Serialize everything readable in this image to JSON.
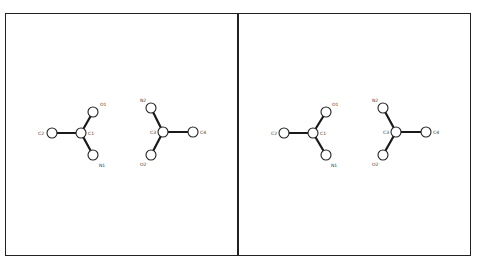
{
  "diagram": {
    "panels": [
      {
        "id": "left",
        "atoms": [
          {
            "label": "C2",
            "x": 52,
            "y": 133,
            "lx": 38,
            "ly": 135
          },
          {
            "label": "C1",
            "x": 81,
            "y": 133,
            "lx": 88,
            "ly": 135
          },
          {
            "label": "O1",
            "x": 93,
            "y": 112,
            "lx": 100,
            "ly": 106
          },
          {
            "label": "N1",
            "x": 93,
            "y": 155,
            "lx": 99,
            "ly": 167
          },
          {
            "label": "N2",
            "x": 151,
            "y": 108,
            "lx": 140,
            "ly": 102
          },
          {
            "label": "C3",
            "x": 163,
            "y": 132,
            "lx": 150,
            "ly": 134
          },
          {
            "label": "C4",
            "x": 193,
            "y": 132,
            "lx": 200,
            "ly": 134
          },
          {
            "label": "O2",
            "x": 151,
            "y": 155,
            "lx": 140,
            "ly": 166
          }
        ],
        "bonds": [
          [
            "C2",
            "C1"
          ],
          [
            "C1",
            "O1"
          ],
          [
            "C1",
            "N1"
          ],
          [
            "C3",
            "N2"
          ],
          [
            "C3",
            "C4"
          ],
          [
            "C3",
            "O2"
          ]
        ]
      },
      {
        "id": "right",
        "atoms": [
          {
            "label": "C2",
            "x": 284,
            "y": 133,
            "lx": 271,
            "ly": 135
          },
          {
            "label": "C1",
            "x": 313,
            "y": 133,
            "lx": 320,
            "ly": 135
          },
          {
            "label": "O1",
            "x": 326,
            "y": 112,
            "lx": 332,
            "ly": 106
          },
          {
            "label": "N1",
            "x": 326,
            "y": 155,
            "lx": 331,
            "ly": 167
          },
          {
            "label": "N2",
            "x": 383,
            "y": 108,
            "lx": 372,
            "ly": 102
          },
          {
            "label": "C3",
            "x": 396,
            "y": 132,
            "lx": 383,
            "ly": 134
          },
          {
            "label": "C4",
            "x": 426,
            "y": 132,
            "lx": 433,
            "ly": 134
          },
          {
            "label": "O2",
            "x": 383,
            "y": 155,
            "lx": 372,
            "ly": 166
          }
        ],
        "bonds": [
          [
            "C2",
            "C1"
          ],
          [
            "C1",
            "O1"
          ],
          [
            "C1",
            "N1"
          ],
          [
            "C3",
            "N2"
          ],
          [
            "C3",
            "C4"
          ],
          [
            "C3",
            "O2"
          ]
        ]
      }
    ],
    "atom_radius": 5
  }
}
